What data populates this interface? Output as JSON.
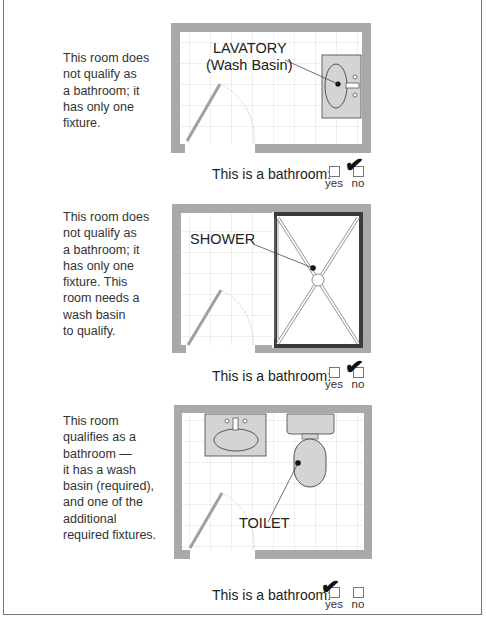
{
  "panels": [
    {
      "description": "This room does\nnot qualify as\na bathroom; it\nhas only one\nfixture.",
      "fixture_label_line1": "LAVATORY",
      "fixture_label_line2": "(Wash Basin)",
      "caption": "This is a bathroom:",
      "yes_label": "yes",
      "no_label": "no",
      "checked": "no",
      "check_glyph": "✔"
    },
    {
      "description": "This room does\nnot qualify as\na bathroom; it\nhas only one\nfixture. This\nroom needs a\nwash basin\nto qualify.",
      "fixture_label_line1": "SHOWER",
      "caption": "This is a bathroom:",
      "yes_label": "yes",
      "no_label": "no",
      "checked": "no",
      "check_glyph": "✔"
    },
    {
      "description": "This room\nqualifies as a\nbathroom —\nit has a wash\nbasin (required),\nand one of the\nadditional\nrequired fixtures.",
      "fixture_label_line1": "TOILET",
      "caption": "This is a bathroom:",
      "yes_label": "yes",
      "no_label": "no",
      "checked": "yes",
      "check_glyph": "✔"
    }
  ],
  "colors": {
    "wall": "#a9a9a9",
    "grid": "#d8d8d8",
    "fixture_fill": "#d4d4d4",
    "shower_border": "#3a3a3a",
    "door": "#a0a0a0"
  }
}
